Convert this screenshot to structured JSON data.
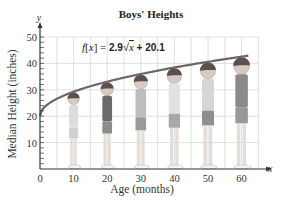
{
  "chart_data": {
    "type": "line",
    "title": "Boys' Heights",
    "xlabel": "Age (months)",
    "ylabel": "Median Height (inches)",
    "x_axis_var": "x",
    "y_axis_var": "y",
    "xlim": [
      0,
      65
    ],
    "ylim": [
      0,
      50
    ],
    "x_ticks": [
      0,
      10,
      20,
      30,
      40,
      50,
      60
    ],
    "y_ticks": [
      10,
      20,
      30,
      40,
      50
    ],
    "grid": true,
    "annotation": "f(x) = 2.9√x + 20.1",
    "function": {
      "a": 2.9,
      "b": 20.1,
      "form": "a*sqrt(x)+b"
    },
    "series": [
      {
        "name": "f(x) = 2.9√x + 20.1",
        "x": [
          0,
          5,
          10,
          15,
          20,
          25,
          30,
          35,
          40,
          45,
          50,
          55,
          60,
          62
        ],
        "values": [
          20.1,
          26.6,
          29.3,
          31.3,
          33.1,
          34.6,
          36.0,
          37.3,
          38.4,
          39.6,
          40.6,
          41.6,
          42.6,
          42.9
        ]
      }
    ],
    "illustrations": [
      {
        "label": "boy-10-months",
        "x": 10
      },
      {
        "label": "boy-20-months",
        "x": 20
      },
      {
        "label": "boy-30-months",
        "x": 30
      },
      {
        "label": "boy-40-months",
        "x": 40
      },
      {
        "label": "boy-50-months",
        "x": 50
      },
      {
        "label": "boy-60-months",
        "x": 60
      }
    ],
    "colors": {
      "curve": "#6e6464",
      "grid": "#d8d8d8",
      "axis": "#333333"
    }
  }
}
